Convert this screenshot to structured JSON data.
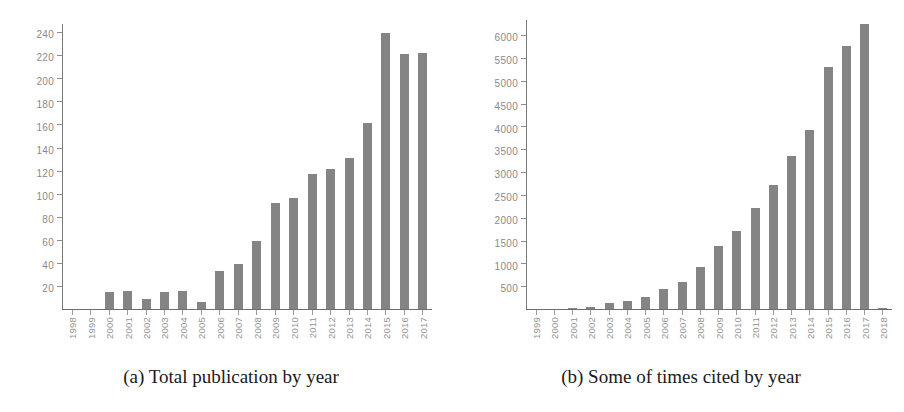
{
  "figure": {
    "panels": [
      {
        "key": "a",
        "caption": "(a) Total publication by year"
      },
      {
        "key": "b",
        "caption": "(b) Some of times cited by year"
      }
    ]
  },
  "chart_data": [
    {
      "type": "bar",
      "title": "(a) Total publication by year",
      "xlabel": "",
      "ylabel": "",
      "grid": false,
      "legend": false,
      "ylim": [
        0,
        248
      ],
      "yticks": [
        20,
        40,
        60,
        80,
        100,
        120,
        140,
        160,
        180,
        200,
        220,
        240
      ],
      "categories": [
        "1998",
        "1999",
        "2000",
        "2001",
        "2002",
        "2003",
        "2004",
        "2005",
        "2006",
        "2007",
        "2008",
        "2009",
        "2010",
        "2011",
        "2012",
        "2013",
        "2014",
        "2015",
        "2016",
        "2017"
      ],
      "values": [
        0,
        0,
        15,
        16,
        9,
        15,
        16,
        6,
        33,
        39,
        59,
        92,
        96,
        117,
        121,
        131,
        161,
        239,
        221,
        222
      ],
      "bar_color": "#848484"
    },
    {
      "type": "bar",
      "title": "(b) Some of times cited by year",
      "xlabel": "",
      "ylabel": "",
      "grid": false,
      "legend": false,
      "ylim": [
        0,
        6350
      ],
      "yticks": [
        500,
        1000,
        1500,
        2000,
        2500,
        3000,
        3500,
        4000,
        4500,
        5000,
        5500,
        6000
      ],
      "categories": [
        "1999",
        "2000",
        "2001",
        "2002",
        "2003",
        "2004",
        "2005",
        "2006",
        "2007",
        "2008",
        "2009",
        "2010",
        "2011",
        "2012",
        "2013",
        "2014",
        "2015",
        "2016",
        "2017",
        "2018"
      ],
      "values": [
        0,
        0,
        20,
        50,
        130,
        170,
        270,
        430,
        600,
        910,
        1390,
        1710,
        2210,
        2710,
        3350,
        3930,
        5300,
        5760,
        6230,
        30
      ],
      "bar_color": "#848484"
    }
  ]
}
